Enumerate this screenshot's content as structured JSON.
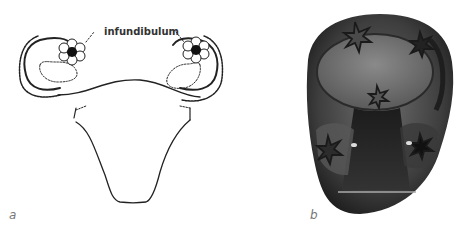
{
  "figure": {
    "panels": [
      {
        "id": "a",
        "letter": "a",
        "description": "Line drawing of uterus with fallopian tubes and ovaries",
        "annotation": "infundibulum"
      },
      {
        "id": "b",
        "letter": "b",
        "description": "Carved stone with bull-head form and star engravings"
      }
    ]
  },
  "colors": {
    "ink": "#222222",
    "stone_dark": "#2a2a2a",
    "stone_mid": "#5a5a5a",
    "stone_light": "#8c8c8c",
    "letter": "#777777"
  }
}
